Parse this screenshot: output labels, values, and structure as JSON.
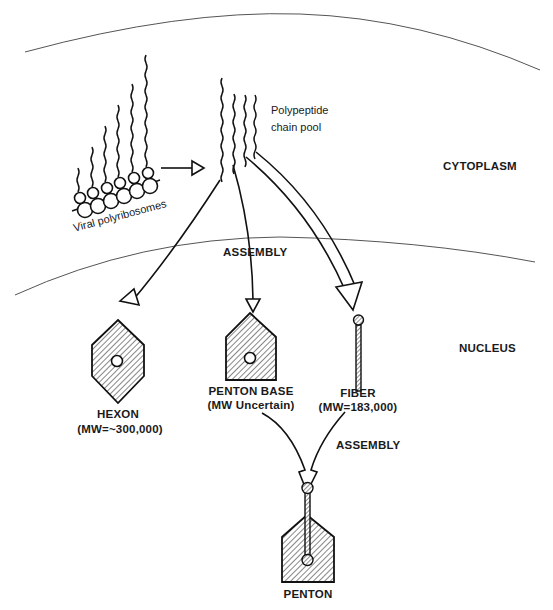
{
  "diagram": {
    "regions": {
      "cytoplasm": "CYTOPLASM",
      "nucleus": "NUCLEUS"
    },
    "labels": {
      "polyribosomes": "Viral polyribosomes",
      "pool_line1": "Polypeptide",
      "pool_line2": "chain pool",
      "assembly_1": "ASSEMBLY",
      "assembly_2": "ASSEMBLY"
    },
    "components": {
      "hexon": {
        "name": "HEXON",
        "mw": "(MW=~300,000)"
      },
      "penton_base": {
        "name": "PENTON BASE",
        "mw": "(MW Uncertain)"
      },
      "fiber": {
        "name": "FIBER",
        "mw": "(MW=183,000)"
      },
      "penton": {
        "name": "PENTON"
      }
    },
    "colors": {
      "ink": "#1a1a1a",
      "membrane": "#555555",
      "background": "#ffffff"
    }
  }
}
